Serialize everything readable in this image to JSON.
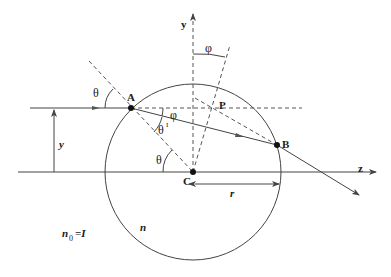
{
  "diagram": {
    "labels": {
      "axis_y": "y",
      "axis_z": "z",
      "point_A": "A",
      "point_B": "B",
      "point_C": "C",
      "point_P": "P",
      "theta_incident": "θ",
      "theta_center": "θ",
      "theta_refracted": "θ",
      "theta_refracted_prime": "I",
      "phi_at_A": "φ",
      "phi_at_top": "φ",
      "height": "y",
      "radius": "r",
      "sphere_index": "n",
      "outside_index_base": "n",
      "outside_index_sub": "0",
      "outside_index_eq": "=I"
    },
    "colors": {
      "line": "#333333",
      "dash": "#555555",
      "text": "#1a1a1a"
    }
  }
}
